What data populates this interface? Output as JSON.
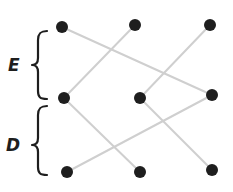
{
  "diagram": {
    "colors": {
      "node": "#1e1e1e",
      "edge": "#cfcfcf",
      "brace": "#1e1e1e",
      "label": "#1e1e1e",
      "background": "#ffffff"
    },
    "groups": [
      {
        "id": "E",
        "label": "E",
        "spans": "top row to middle row"
      },
      {
        "id": "D",
        "label": "D",
        "spans": "middle row to bottom row"
      }
    ],
    "nodes": [
      {
        "id": "t1",
        "row": "top",
        "col": 1,
        "x": 62,
        "y": 27
      },
      {
        "id": "t2",
        "row": "top",
        "col": 2,
        "x": 135,
        "y": 25
      },
      {
        "id": "t3",
        "row": "top",
        "col": 3,
        "x": 210,
        "y": 25
      },
      {
        "id": "m1",
        "row": "middle",
        "col": 1,
        "x": 64,
        "y": 98
      },
      {
        "id": "m2",
        "row": "middle",
        "col": 2,
        "x": 140,
        "y": 98
      },
      {
        "id": "m3",
        "row": "middle",
        "col": 3,
        "x": 212,
        "y": 95
      },
      {
        "id": "b1",
        "row": "bottom",
        "col": 1,
        "x": 67,
        "y": 172
      },
      {
        "id": "b2",
        "row": "bottom",
        "col": 2,
        "x": 140,
        "y": 172
      },
      {
        "id": "b3",
        "row": "bottom",
        "col": 3,
        "x": 212,
        "y": 170
      }
    ],
    "edges": [
      {
        "from": "t1",
        "to": "m3",
        "group": "E"
      },
      {
        "from": "t2",
        "to": "m1",
        "group": "E"
      },
      {
        "from": "t3",
        "to": "m2",
        "group": "E"
      },
      {
        "from": "m1",
        "to": "b2",
        "group": "D"
      },
      {
        "from": "m2",
        "to": "b3",
        "group": "D"
      },
      {
        "from": "m3",
        "to": "b1",
        "group": "D"
      }
    ]
  }
}
